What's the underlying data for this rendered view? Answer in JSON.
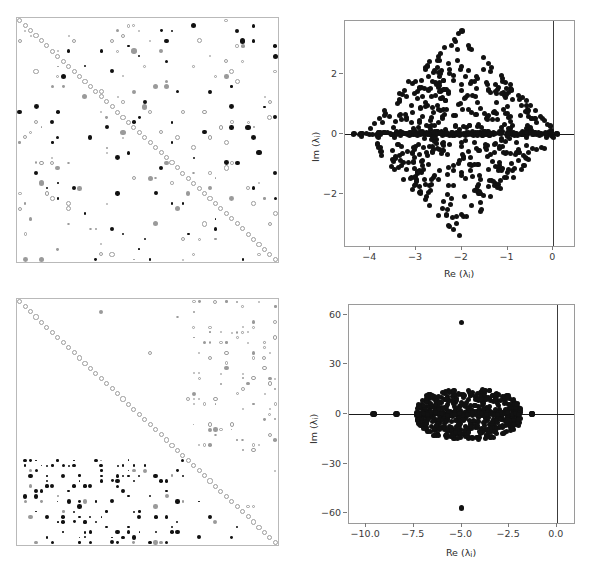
{
  "figure": {
    "title": "",
    "panel_count": 4,
    "background": "#ffffff"
  },
  "axis_titles": {
    "re": "Re (",
    "im": "Im (",
    "lambda": "λ",
    "sub_i": "i",
    "close": ")"
  },
  "panels": {
    "top_left": {
      "name": "sparsity-matrix-top",
      "type": "spy",
      "frame_color": "#b9b9b9",
      "n": 48,
      "description": "Jacobian sparsity pattern, scattered structure with open-circle diagonal"
    },
    "bottom_left": {
      "name": "sparsity-matrix-bottom",
      "type": "spy",
      "frame_color": "#b9b9b9",
      "n": 48,
      "description": "Jacobian sparsity pattern, block structure with open-circle diagonal"
    },
    "top_right": {
      "name": "eigenvalue-scatter-top",
      "type": "scatter"
    },
    "bottom_right": {
      "name": "eigenvalue-scatter-bottom",
      "type": "scatter"
    }
  },
  "chart_data": [
    {
      "id": "eigenvalue-spectrum-top",
      "type": "scatter",
      "title": "",
      "xlabel": "Re (λᵢ)",
      "ylabel": "Im (λᵢ)",
      "xlim": [
        -4.55,
        0.45
      ],
      "ylim": [
        -3.75,
        3.75
      ],
      "xticks": [
        -4,
        -3,
        -2,
        -1,
        0
      ],
      "xticklabels": [
        "−4",
        "−3",
        "−2",
        "−1",
        "0"
      ],
      "yticks": [
        2,
        0,
        -2
      ],
      "yticklabels": [
        "2",
        "0",
        "−2"
      ],
      "grid": false,
      "legend": null,
      "marker_color": "#111111",
      "marker_size_px": 5,
      "reference_lines": [
        {
          "name": "imaginary-axis",
          "orientation": "vertical",
          "value": 0,
          "color": "#3c3c3c"
        },
        {
          "name": "real-axis",
          "orientation": "horizontal",
          "value": 0,
          "color": "#1a1a1a"
        }
      ],
      "point_count": 700,
      "distribution": "diamond/rhombus cloud centred near Re=-2, vertices approx (-4.35,0), (0.1,0), (-2,3.4), (-2,-3.4); dense spine of real eigenvalues along Im=0",
      "notable_points": [
        {
          "re": -2.0,
          "im": 3.42
        },
        {
          "re": -2.05,
          "im": -3.4
        },
        {
          "re": 0.08,
          "im": 0.0
        },
        {
          "re": -4.35,
          "im": 0.0
        }
      ]
    },
    {
      "id": "eigenvalue-spectrum-bottom",
      "type": "scatter",
      "title": "",
      "xlabel": "Re (λᵢ)",
      "ylabel": "Im (λᵢ)",
      "xlim": [
        -10.9,
        0.9
      ],
      "ylim": [
        -66,
        66
      ],
      "xticks": [
        -10.0,
        -7.5,
        -5.0,
        -2.5,
        0.0
      ],
      "xticklabels": [
        "−10.0",
        "−7.5",
        "−5.0",
        "−2.5",
        "0.0"
      ],
      "yticks": [
        60,
        30,
        0,
        -30,
        -60
      ],
      "yticklabels": [
        "60",
        "30",
        "0",
        "−30",
        "−60"
      ],
      "grid": false,
      "legend": null,
      "marker_color": "#111111",
      "marker_size_px": 5,
      "reference_lines": [
        {
          "name": "imaginary-axis",
          "orientation": "vertical",
          "value": 0,
          "color": "#3c3c3c"
        },
        {
          "name": "real-axis",
          "orientation": "horizontal",
          "value": 0,
          "color": "#1a1a1a"
        }
      ],
      "point_count": 700,
      "distribution": "flat lens-shaped cloud from Re=-7.3 to Re=-1.9 with |Im| up to about 15, plus isolated real eigenvalues at -9.6, -8.4 and -1.3",
      "notable_points": [
        {
          "re": -5.0,
          "im": 55.5
        },
        {
          "re": -5.0,
          "im": -57.0
        },
        {
          "re": -9.6,
          "im": 0.0
        },
        {
          "re": -8.4,
          "im": 0.0
        },
        {
          "re": -1.3,
          "im": 0.0
        }
      ]
    }
  ]
}
